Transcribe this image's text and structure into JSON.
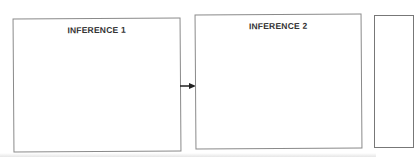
{
  "diagram": {
    "boxes": [
      {
        "id": "box1",
        "label": "INFERENCE 1"
      },
      {
        "id": "box2",
        "label": "INFERENCE 2"
      },
      {
        "id": "box3",
        "label": ""
      }
    ],
    "connectors": [
      {
        "from": "box1",
        "to": "box2",
        "type": "arrow"
      }
    ],
    "colors": {
      "border": "#8a8a8a",
      "text": "#333333",
      "arrow": "#222222"
    }
  }
}
